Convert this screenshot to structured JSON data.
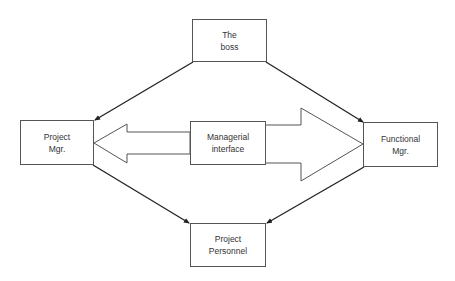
{
  "diagram": {
    "type": "organizational-relationship",
    "nodes": [
      {
        "id": "boss",
        "label": "The\nboss"
      },
      {
        "id": "project_mgr",
        "label": "Project\nMgr."
      },
      {
        "id": "managerial_interface",
        "label": "Managerial\ninterface"
      },
      {
        "id": "functional_mgr",
        "label": "Functional\nMgr."
      },
      {
        "id": "project_personnel",
        "label": "Project\nPersonnel"
      }
    ],
    "edges": [
      {
        "from": "boss",
        "to": "project_mgr",
        "style": "line-arrow"
      },
      {
        "from": "boss",
        "to": "functional_mgr",
        "style": "line-arrow"
      },
      {
        "from": "project_mgr",
        "to": "project_personnel",
        "style": "line-arrow"
      },
      {
        "from": "functional_mgr",
        "to": "project_personnel",
        "style": "line-arrow"
      },
      {
        "from": "managerial_interface",
        "to": "project_mgr",
        "style": "small-block-arrow"
      },
      {
        "from": "managerial_interface",
        "to": "functional_mgr",
        "style": "large-block-arrow"
      }
    ],
    "colors": {
      "stroke": "#333333",
      "text": "#333333",
      "background": "#ffffff"
    }
  }
}
